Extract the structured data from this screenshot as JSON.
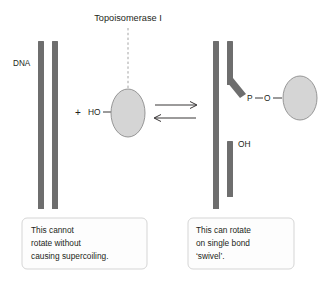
{
  "figure": {
    "title": "Topoisomerase I",
    "dna_label": "DNA",
    "plus_sign": "+",
    "left_hydroxyl_label": "HO",
    "phosphate_label": "P",
    "oxygen_label": "O",
    "right_hydroxyl_label": "OH",
    "dash_between_p_o": "—",
    "colors": {
      "dna_strand": "#6e6e6e",
      "enzyme_fill": "#d5d5d5",
      "enzyme_stroke": "#8c8c8c",
      "text": "#231f20",
      "leader_dash": "#9a9a9a",
      "callout_border": "#d0d0d0",
      "background": "#ffffff"
    }
  },
  "callouts": {
    "left": {
      "lines": [
        "This cannot",
        "rotate without",
        "causing supercoiling."
      ]
    },
    "right": {
      "lines": [
        "This can rotate",
        "on single bond",
        "‘swivel’."
      ]
    }
  },
  "reaction": {
    "equilibrium_forward": "right-arrow",
    "equilibrium_reverse": "left-arrow"
  }
}
